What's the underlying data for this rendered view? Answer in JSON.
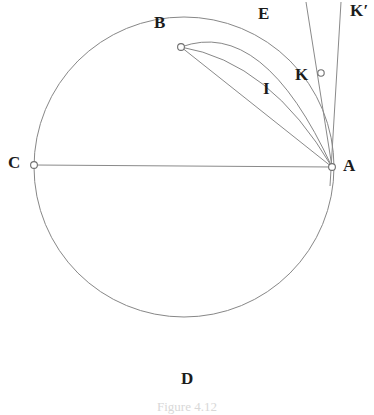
{
  "figure": {
    "type": "geometry-diagram",
    "caption": "Figure 4.12",
    "background_color": "#ffffff",
    "stroke_color": "#878787",
    "label_color": "#1c1c1c"
  },
  "labels": {
    "a": "A",
    "b": "B",
    "c": "C",
    "d": "D",
    "e": "E",
    "i": "I",
    "k": "K",
    "k_prime": "K′"
  },
  "points": [
    {
      "name": "A",
      "label": "A",
      "x": 332,
      "y": 167,
      "marker": true,
      "label_x": 344,
      "label_y": 158
    },
    {
      "name": "B",
      "label": "B",
      "x": 181,
      "y": 47,
      "marker": true,
      "label_x": 155,
      "label_y": 15
    },
    {
      "name": "C",
      "label": "C",
      "x": 34,
      "y": 165,
      "marker": true,
      "label_x": 10,
      "label_y": 155
    },
    {
      "name": "D",
      "label": "D",
      "x": 185,
      "y": 364,
      "marker": false,
      "label_x": 183,
      "label_y": 372
    },
    {
      "name": "K",
      "label": "K",
      "x": 321,
      "y": 73,
      "marker": true,
      "label_x": 296,
      "label_y": 68
    }
  ],
  "floating_labels": [
    {
      "name": "E",
      "label": "E",
      "x": 259,
      "y": 6
    },
    {
      "name": "I",
      "label": "I",
      "x": 262,
      "y": 80
    },
    {
      "name": "K-prime",
      "label": "K′",
      "x": 352,
      "y": 3
    }
  ],
  "circle": {
    "name": "main-circle",
    "center_x": 184,
    "center_y": 167,
    "radius": 150
  },
  "chord": {
    "name": "chord-CA",
    "from": "C",
    "to": "A",
    "x1": 34,
    "y1": 165,
    "x2": 332,
    "y2": 167
  },
  "segments": [
    {
      "name": "segment-BA",
      "x1": 181,
      "y1": 47,
      "x2": 332,
      "y2": 167
    },
    {
      "name": "tangent-line-K",
      "x1": 307,
      "y1": 2,
      "x2": 332,
      "y2": 167
    },
    {
      "name": "tangent-line-K-prime",
      "x1": 340,
      "y1": 2,
      "x2": 330,
      "y2": 183
    }
  ],
  "arcs": [
    {
      "name": "arc-E-outer",
      "d": "M 181 47 Q 262 18 332 167"
    },
    {
      "name": "arc-I-inner",
      "d": "M 181 47 Q 268 60 332 167"
    }
  ]
}
